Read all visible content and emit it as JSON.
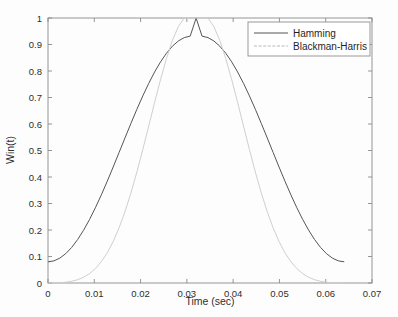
{
  "chart_data": {
    "type": "line",
    "title": "",
    "xlabel": "Time (sec)",
    "ylabel": "Win(t)",
    "xlim": [
      0,
      0.07
    ],
    "ylim": [
      0,
      1
    ],
    "xticks": [
      "0",
      "0.01",
      "0.02",
      "0.03",
      "0.04",
      "0.05",
      "0.06",
      "0.07"
    ],
    "xtick_values": [
      0,
      0.01,
      0.02,
      0.03,
      0.04,
      0.05,
      0.06,
      0.07
    ],
    "yticks": [
      "0",
      "0.1",
      "0.2",
      "0.3",
      "0.4",
      "0.5",
      "0.6",
      "0.7",
      "0.8",
      "0.9",
      "1"
    ],
    "ytick_values": [
      0,
      0.1,
      0.2,
      0.3,
      0.4,
      0.5,
      0.6,
      0.7,
      0.8,
      0.9,
      1
    ],
    "grid": false,
    "legend_position": "top-right",
    "series": [
      {
        "name": "Hamming",
        "color": "#555555",
        "style": "solid",
        "x": [
          0,
          0.00128,
          0.00256,
          0.00384,
          0.00512,
          0.0064,
          0.00768,
          0.00896,
          0.01024,
          0.01152,
          0.0128,
          0.01408,
          0.01536,
          0.01664,
          0.01792,
          0.0192,
          0.02048,
          0.02176,
          0.02304,
          0.02432,
          0.0256,
          0.02688,
          0.02816,
          0.02944,
          0.03072,
          0.032,
          0.03328,
          0.03456,
          0.03584,
          0.03712,
          0.0384,
          0.03968,
          0.04096,
          0.04224,
          0.04352,
          0.0448,
          0.04608,
          0.04736,
          0.04864,
          0.04992,
          0.0512,
          0.05248,
          0.05376,
          0.05504,
          0.05632,
          0.0576,
          0.05888,
          0.06016,
          0.06144,
          0.06272,
          0.064
        ],
        "y": [
          0.08,
          0.0835,
          0.0939,
          0.1109,
          0.1343,
          0.1639,
          0.199,
          0.2393,
          0.284,
          0.3325,
          0.384,
          0.4376,
          0.4925,
          0.5477,
          0.6023,
          0.6554,
          0.706,
          0.7533,
          0.7964,
          0.8346,
          0.8672,
          0.8936,
          0.9133,
          0.9261,
          0.9316,
          0.9997,
          0.9316,
          0.9261,
          0.9133,
          0.8936,
          0.8672,
          0.8346,
          0.7964,
          0.7533,
          0.706,
          0.6554,
          0.6023,
          0.5477,
          0.4925,
          0.4376,
          0.384,
          0.3325,
          0.284,
          0.2393,
          0.199,
          0.1639,
          0.1343,
          0.1109,
          0.0939,
          0.0835,
          0.08
        ]
      },
      {
        "name": "Blackman-Harris",
        "color": "#cfcfcf",
        "style": "dashed",
        "x": [
          0,
          0.00128,
          0.00256,
          0.00384,
          0.00512,
          0.0064,
          0.00768,
          0.00896,
          0.01024,
          0.01152,
          0.0128,
          0.01408,
          0.01536,
          0.01664,
          0.01792,
          0.0192,
          0.02048,
          0.02176,
          0.02304,
          0.02432,
          0.0256,
          0.02688,
          0.02816,
          0.02944,
          0.03072,
          0.032,
          0.03328,
          0.03456,
          0.03584,
          0.03712,
          0.0384,
          0.03968,
          0.04096,
          0.04224,
          0.04352,
          0.0448,
          0.04608,
          0.04736,
          0.04864,
          0.04992,
          0.0512,
          0.05248,
          0.05376,
          0.05504,
          0.05632,
          0.0576,
          0.05888,
          0.06016,
          0.06144,
          0.06272,
          0.064
        ],
        "y": [
          6e-05,
          0.0003,
          0.0011,
          0.003,
          0.0065,
          0.0124,
          0.0216,
          0.0352,
          0.0544,
          0.0803,
          0.114,
          0.1564,
          0.2082,
          0.2695,
          0.34,
          0.4186,
          0.5035,
          0.5923,
          0.6817,
          0.768,
          0.8471,
          0.915,
          0.9676,
          0.9999,
          0.9999,
          1.0,
          0.9999,
          0.9999,
          0.9676,
          0.915,
          0.8471,
          0.768,
          0.6817,
          0.5923,
          0.5035,
          0.4186,
          0.34,
          0.2695,
          0.2082,
          0.1564,
          0.114,
          0.0803,
          0.0544,
          0.0352,
          0.0216,
          0.0124,
          0.0065,
          0.003,
          0.0011,
          0.0003,
          6e-05
        ]
      }
    ]
  },
  "legend": {
    "entries": [
      {
        "label": "Hamming"
      },
      {
        "label": "Blackman-Harris"
      }
    ]
  },
  "axes": {
    "x_title": "Time (sec)",
    "y_title": "Win(t)"
  }
}
